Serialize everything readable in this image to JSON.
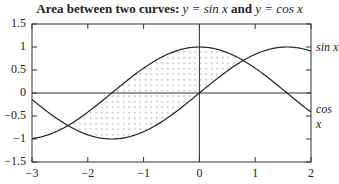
{
  "chart_data": {
    "type": "line",
    "title_prefix": "Area between two curves:",
    "title_eq1": "y = sin x",
    "title_and": "and",
    "title_eq2": "y = cos x",
    "xlabel": "",
    "ylabel": "",
    "xlim": [
      -3,
      2
    ],
    "ylim": [
      -1.5,
      1.5
    ],
    "xticks": [
      "−3",
      "−2",
      "−1",
      "0",
      "1",
      "2"
    ],
    "xtick_values": [
      -3,
      -2,
      -1,
      0,
      1,
      2
    ],
    "yticks": [
      "1.5",
      "1",
      "0.5",
      "0",
      "−0.5",
      "−1",
      "−1.5"
    ],
    "ytick_values": [
      1.5,
      1,
      0.5,
      0,
      -0.5,
      -1,
      -1.5
    ],
    "series": [
      {
        "name": "sin x",
        "function": "sin",
        "label": "sin x"
      },
      {
        "name": "cos x",
        "function": "cos",
        "label": "cos x"
      }
    ],
    "shaded_region": {
      "between": [
        "sin x",
        "cos x"
      ],
      "x_from": -2.356,
      "x_to": 0.785,
      "pattern": "dots"
    },
    "reference_lines": {
      "y0": true,
      "x0": true
    },
    "grid": false,
    "legend_position": "right, inline labels"
  },
  "colors": {
    "line": "#222222",
    "frame": "#333333",
    "dots": "#555555"
  }
}
